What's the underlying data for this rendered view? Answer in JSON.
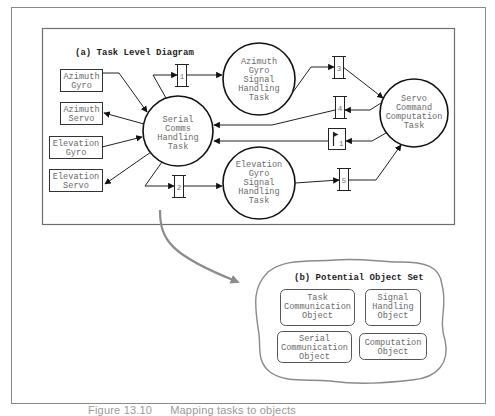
{
  "figure": {
    "caption_number": "Figure 13.10",
    "caption_text": "Mapping tasks to objects"
  },
  "diagram_a": {
    "title": "(a) Task Level Diagram",
    "devices": [
      {
        "id": "azimuth-gyro",
        "lines": [
          "Azimuth",
          "Gyro"
        ]
      },
      {
        "id": "azimuth-servo",
        "lines": [
          "Azimuth",
          "Servo"
        ]
      },
      {
        "id": "elevation-gyro",
        "lines": [
          "Elevation",
          "Gyro"
        ]
      },
      {
        "id": "elevation-servo",
        "lines": [
          "Elevation",
          "Servo"
        ]
      }
    ],
    "tasks": [
      {
        "id": "serial-comms",
        "lines": [
          "Serial",
          "Comms",
          "Handling",
          "Task"
        ]
      },
      {
        "id": "azimuth-gyro-signal",
        "lines": [
          "Azimuth",
          "Gyro",
          "Signal",
          "Handling",
          "Task"
        ]
      },
      {
        "id": "elevation-gyro-signal",
        "lines": [
          "Elevation",
          "Gyro",
          "Signal",
          "Handling",
          "Task"
        ]
      },
      {
        "id": "servo-command",
        "lines": [
          "Servo",
          "Command",
          "Computation",
          "Task"
        ]
      }
    ],
    "queues": [
      {
        "id": "queue-1",
        "label": "1"
      },
      {
        "id": "queue-2",
        "label": "2"
      },
      {
        "id": "queue-3",
        "label": "3"
      },
      {
        "id": "queue-4",
        "label": "4"
      },
      {
        "id": "queue-5",
        "label": "5"
      }
    ],
    "flags": [
      {
        "id": "flag-1",
        "label": "1"
      }
    ]
  },
  "diagram_b": {
    "title": "(b) Potential Object Set",
    "objects": [
      {
        "id": "task-communication-object",
        "lines": [
          "Task",
          "Communication",
          "Object"
        ]
      },
      {
        "id": "signal-handling-object",
        "lines": [
          "Signal",
          "Handling",
          "Object"
        ]
      },
      {
        "id": "serial-communication-object",
        "lines": [
          "Serial",
          "Communication",
          "Object"
        ]
      },
      {
        "id": "computation-object",
        "lines": [
          "Computation",
          "Object"
        ]
      }
    ]
  },
  "colors": {
    "frame": "#7a7a7a",
    "stroke": "#1a1a1a",
    "label": "#6a6a6a",
    "mapping_arrow": "#8c8c8c"
  }
}
